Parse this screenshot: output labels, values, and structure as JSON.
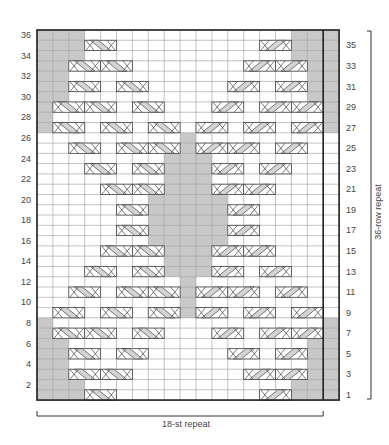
{
  "chart_data": {
    "type": "heatmap",
    "title": "",
    "columns": 19,
    "rows": 36,
    "left_row_labels": [
      2,
      4,
      6,
      8,
      10,
      12,
      14,
      16,
      18,
      20,
      22,
      24,
      26,
      28,
      30,
      32,
      34,
      36
    ],
    "right_row_labels": [
      1,
      3,
      5,
      7,
      9,
      11,
      13,
      15,
      17,
      19,
      21,
      23,
      25,
      27,
      29,
      31,
      33,
      35
    ],
    "bottom_label": "18-st repeat",
    "side_label": "36-row repeat",
    "repeat_columns": [
      1,
      18
    ],
    "thick_divider_after_column": 18,
    "colors": {
      "shade": "#c8c8c8",
      "grid": "#9a9a9a",
      "border": "#222222",
      "cable_fill": "#d4d4d4",
      "cable_light": "#f2f2f2"
    },
    "shaded": {
      "1": [
        1,
        2,
        3,
        17,
        18,
        19
      ],
      "2": [
        1,
        2,
        3,
        17,
        18,
        19
      ],
      "3": [
        1,
        2,
        18,
        19
      ],
      "4": [
        1,
        2,
        18,
        19
      ],
      "5": [
        1,
        2,
        18,
        19
      ],
      "6": [
        1,
        2,
        18,
        19
      ],
      "7": [
        1,
        19
      ],
      "8": [
        1,
        19
      ],
      "9": [
        10
      ],
      "10": [
        10
      ],
      "11": [
        10
      ],
      "12": [
        10
      ],
      "13": [
        9,
        10,
        11
      ],
      "14": [
        9,
        10,
        11
      ],
      "15": [
        9,
        10,
        11
      ],
      "16": [
        8,
        9,
        10,
        11,
        12
      ],
      "17": [
        8,
        9,
        10,
        11,
        12
      ],
      "18": [
        8,
        9,
        10,
        11,
        12
      ],
      "19": [
        8,
        9,
        10,
        11,
        12
      ],
      "20": [
        8,
        9,
        10,
        11,
        12
      ],
      "21": [
        9,
        10,
        11
      ],
      "22": [
        9,
        10,
        11
      ],
      "23": [
        9,
        10,
        11
      ],
      "24": [
        9,
        10,
        11
      ],
      "25": [
        10
      ],
      "26": [
        10
      ],
      "27": [
        1,
        19
      ],
      "28": [
        1,
        19
      ],
      "29": [
        1,
        18,
        19
      ],
      "30": [
        1,
        2,
        18,
        19
      ],
      "31": [
        1,
        2,
        18,
        19
      ],
      "32": [
        1,
        2,
        18,
        19
      ],
      "33": [
        1,
        2,
        18,
        19
      ],
      "34": [
        1,
        2,
        3,
        17,
        18,
        19
      ],
      "35": [
        1,
        2,
        3,
        17,
        18,
        19
      ],
      "36": [
        1,
        2,
        3,
        17,
        18,
        19
      ]
    },
    "cables": {
      "1": [
        [
          4,
          "L"
        ],
        [
          15,
          "R"
        ]
      ],
      "3": [
        [
          3,
          "L"
        ],
        [
          5,
          "L"
        ],
        [
          14,
          "R"
        ],
        [
          16,
          "R"
        ]
      ],
      "5": [
        [
          3,
          "L"
        ],
        [
          6,
          "L"
        ],
        [
          13,
          "R"
        ],
        [
          16,
          "R"
        ]
      ],
      "7": [
        [
          2,
          "L"
        ],
        [
          4,
          "L"
        ],
        [
          7,
          "L"
        ],
        [
          12,
          "R"
        ],
        [
          15,
          "R"
        ],
        [
          17,
          "R"
        ]
      ],
      "9": [
        [
          2,
          "L"
        ],
        [
          5,
          "L"
        ],
        [
          8,
          "L"
        ],
        [
          11,
          "R"
        ],
        [
          14,
          "R"
        ],
        [
          17,
          "R"
        ]
      ],
      "11": [
        [
          3,
          "L"
        ],
        [
          6,
          "L"
        ],
        [
          8,
          "L"
        ],
        [
          11,
          "R"
        ],
        [
          13,
          "R"
        ],
        [
          16,
          "R"
        ]
      ],
      "13": [
        [
          4,
          "L"
        ],
        [
          7,
          "L"
        ],
        [
          12,
          "R"
        ],
        [
          15,
          "R"
        ]
      ],
      "15": [
        [
          5,
          "L"
        ],
        [
          7,
          "L"
        ],
        [
          12,
          "R"
        ],
        [
          14,
          "R"
        ]
      ],
      "17": [
        [
          6,
          "L"
        ],
        [
          13,
          "R"
        ]
      ],
      "19": [
        [
          6,
          "L"
        ],
        [
          13,
          "R"
        ]
      ],
      "21": [
        [
          5,
          "L"
        ],
        [
          7,
          "L"
        ],
        [
          12,
          "R"
        ],
        [
          14,
          "R"
        ]
      ],
      "23": [
        [
          4,
          "L"
        ],
        [
          7,
          "L"
        ],
        [
          12,
          "R"
        ],
        [
          15,
          "R"
        ]
      ],
      "25": [
        [
          3,
          "L"
        ],
        [
          6,
          "L"
        ],
        [
          8,
          "L"
        ],
        [
          11,
          "R"
        ],
        [
          13,
          "R"
        ],
        [
          16,
          "R"
        ]
      ],
      "27": [
        [
          2,
          "L"
        ],
        [
          5,
          "L"
        ],
        [
          8,
          "L"
        ],
        [
          11,
          "R"
        ],
        [
          14,
          "R"
        ],
        [
          17,
          "R"
        ]
      ],
      "29": [
        [
          2,
          "L"
        ],
        [
          4,
          "L"
        ],
        [
          7,
          "L"
        ],
        [
          12,
          "R"
        ],
        [
          15,
          "R"
        ],
        [
          17,
          "R"
        ]
      ],
      "31": [
        [
          3,
          "L"
        ],
        [
          6,
          "L"
        ],
        [
          13,
          "R"
        ],
        [
          16,
          "R"
        ]
      ],
      "33": [
        [
          3,
          "L"
        ],
        [
          5,
          "L"
        ],
        [
          14,
          "R"
        ],
        [
          16,
          "R"
        ]
      ],
      "35": [
        [
          4,
          "L"
        ],
        [
          15,
          "R"
        ]
      ]
    }
  }
}
